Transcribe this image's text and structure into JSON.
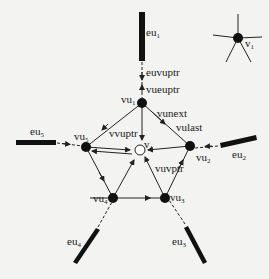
{
  "diagram": {
    "nodes": {
      "vu1": {
        "label": "vu",
        "sub": "1"
      },
      "vu2": {
        "label": "vu",
        "sub": "2"
      },
      "vu3": {
        "label": "vu",
        "sub": "3"
      },
      "vu4": {
        "label": "vu",
        "sub": "4"
      },
      "vu5": {
        "label": "vu",
        "sub": "5"
      },
      "v1": {
        "label": "v",
        "sub": "1"
      },
      "legend_v1": {
        "label": "v",
        "sub": "1"
      }
    },
    "edges": {
      "eu1": {
        "label": "eu",
        "sub": "1"
      },
      "eu2": {
        "label": "eu",
        "sub": "2"
      },
      "eu3": {
        "label": "eu",
        "sub": "3"
      },
      "eu4": {
        "label": "eu",
        "sub": "4"
      },
      "eu5": {
        "label": "eu",
        "sub": "5"
      }
    },
    "pointers": {
      "euvuptr": "euvuptr",
      "vueuptr": "vueuptr",
      "vunext": "vunext",
      "vulast": "vulast",
      "vvuptr": "vvuptr",
      "vuvptr": "vuvptr"
    }
  }
}
